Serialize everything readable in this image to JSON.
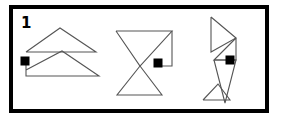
{
  "panel": {
    "number_label": "1",
    "border_color": "#000000",
    "background_color": "#ffffff",
    "frame": {
      "x": 11,
      "y": 7,
      "width": 256,
      "height": 104
    }
  },
  "style": {
    "shape_stroke_color": "#555555",
    "shape_stroke_width": 1.1,
    "marker_color": "#000000",
    "frame_stroke_width": 4
  },
  "chart_data": {
    "type": "diagram",
    "title": "1",
    "xlabel": "",
    "ylabel": "",
    "figures": [
      {
        "id": "figure-1",
        "name": "stacked-triangles",
        "marker": {
          "x": 25,
          "y": 61,
          "size": 9
        },
        "polylines": [
          {
            "name": "upper-triangle",
            "points": "26,52 60,28 96,52 26,52"
          },
          {
            "name": "lower-triangle",
            "points": "26,70 62,51 99,76 26,76 26,61"
          }
        ]
      },
      {
        "id": "figure-2",
        "name": "bowtie-with-square-tail",
        "marker": {
          "x": 158,
          "y": 63,
          "size": 9
        },
        "polylines": [
          {
            "name": "upper-triangle",
            "points": "116,31 172,31 140,66 116,31"
          },
          {
            "name": "lower-triangle",
            "points": "140,66 162,95 117,95 140,66"
          },
          {
            "name": "right-angle-tail",
            "points": "172,31 172,66 154,66"
          }
        ]
      },
      {
        "id": "figure-3",
        "name": "arrow-triangles-vertical",
        "marker": {
          "x": 230,
          "y": 60,
          "size": 9
        },
        "polylines": [
          {
            "name": "upper-triangle",
            "points": "211,17 236,38 211,52 211,17"
          },
          {
            "name": "mid-chevron",
            "points": "236,38 214,60 236,60 236,38"
          },
          {
            "name": "lower-long-triangle",
            "points": "214,60 236,60 225,103 214,60"
          },
          {
            "name": "bottom-small-triangle",
            "points": "203,100 230,100 218,84 203,100"
          }
        ]
      }
    ]
  }
}
